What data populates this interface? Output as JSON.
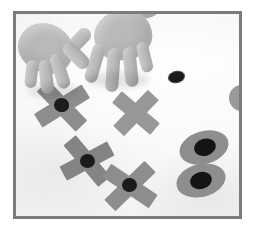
{
  "image": {
    "kind": "photograph",
    "title": "Hands arranging paper X shapes and oval shapes",
    "width": 262,
    "height": 239,
    "background_color": "#ffffff",
    "color_mode": "grayscale"
  },
  "frame": {
    "name": "photo-frame",
    "border_color": "#7b7b7b",
    "border_width_px": 3,
    "left": 13,
    "top": 11,
    "width": 229,
    "height": 208,
    "inner_background": "#fdfdfd"
  },
  "palette": {
    "paper_gray": "#8d8d8d",
    "paper_gray_light": "#979797",
    "paper_gray_dark": "#848484",
    "dot_black": "#1b1b1b",
    "skin_gray": "#bdbdbd",
    "skin_gray_shadow": "#b4b4b4",
    "surface_white": "#fdfdfd"
  },
  "scene": {
    "description": "Two hands reach down from the top of the frame onto a white surface where five gray paper cross (X) shapes and two gray ovals are arranged, each marked with a black circular dot at its center.",
    "hands": [
      {
        "name": "left-hand",
        "side": "left",
        "action": "pinching a black dot onto an X shape",
        "enters_from": "top-left"
      },
      {
        "name": "right-hand",
        "side": "right",
        "action": "fingers spread, reaching toward the X shape",
        "enters_from": "top"
      }
    ],
    "x_shapes": [
      {
        "name": "x-shape-1",
        "label": "upper-left X",
        "x": 62,
        "y": 110,
        "size": 58,
        "rotation": 8,
        "has_center_dot": true,
        "dot_size": 13
      },
      {
        "name": "x-shape-2",
        "label": "upper-right X",
        "x": 145,
        "y": 118,
        "size": 54,
        "rotation": -2,
        "has_center_dot": false,
        "dot_size": 0
      },
      {
        "name": "x-shape-3",
        "label": "lower-left X",
        "x": 99,
        "y": 169,
        "size": 56,
        "rotation": 14,
        "has_center_dot": true,
        "dot_size": 14
      },
      {
        "name": "x-shape-4",
        "label": "bottom X",
        "x": 140,
        "y": 191,
        "size": 56,
        "rotation": -6,
        "has_center_dot": true,
        "dot_size": 14
      }
    ],
    "ovals": [
      {
        "name": "oval-1",
        "label": "upper oval",
        "x": 209,
        "y": 151,
        "width": 50,
        "height": 33,
        "rotation": -16,
        "dot_width": 21,
        "dot_height": 17
      },
      {
        "name": "oval-2",
        "label": "lower oval",
        "x": 205,
        "y": 184,
        "width": 50,
        "height": 33,
        "rotation": -14,
        "dot_width": 21,
        "dot_height": 17
      }
    ],
    "loose_dots": [
      {
        "name": "loose-dot-1",
        "label": "free black dot near top right",
        "x": 172,
        "y": 80,
        "width": 16,
        "height": 12,
        "rotation": -12
      }
    ],
    "partial_shapes": [
      {
        "name": "partial-circle-right-edge",
        "label": "gray circle cut off by right frame edge",
        "x": 238,
        "y": 95,
        "diameter": 26
      }
    ]
  },
  "counts": {
    "hands": 2,
    "x_shapes": 4,
    "ovals": 2,
    "loose_dots": 1,
    "partial_shapes": 1
  }
}
